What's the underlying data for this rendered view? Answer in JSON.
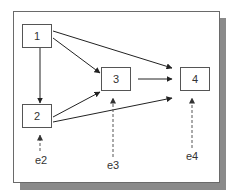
{
  "diagram": {
    "type": "path-diagram",
    "nodes": [
      {
        "id": "1",
        "label": "1"
      },
      {
        "id": "2",
        "label": "2"
      },
      {
        "id": "3",
        "label": "3"
      },
      {
        "id": "4",
        "label": "4"
      }
    ],
    "error_terms": [
      {
        "id": "e2",
        "label": "e2",
        "target": "2"
      },
      {
        "id": "e3",
        "label": "e3",
        "target": "3"
      },
      {
        "id": "e4",
        "label": "e4",
        "target": "4"
      }
    ],
    "edges": [
      {
        "from": "1",
        "to": "2",
        "style": "solid"
      },
      {
        "from": "1",
        "to": "3",
        "style": "solid"
      },
      {
        "from": "1",
        "to": "4",
        "style": "solid"
      },
      {
        "from": "2",
        "to": "3",
        "style": "solid"
      },
      {
        "from": "2",
        "to": "4",
        "style": "solid"
      },
      {
        "from": "3",
        "to": "4",
        "style": "solid"
      },
      {
        "from": "e2",
        "to": "2",
        "style": "dashed"
      },
      {
        "from": "e3",
        "to": "3",
        "style": "dashed"
      },
      {
        "from": "e4",
        "to": "4",
        "style": "dashed"
      }
    ]
  },
  "colors": {
    "line": "#222222",
    "dashed": "#555555",
    "border": "#555555",
    "shadow": "#8a8a8a"
  }
}
